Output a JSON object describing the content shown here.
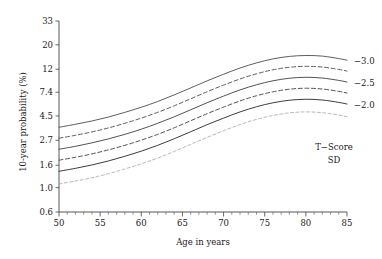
{
  "chart_data": {
    "type": "line",
    "title": "",
    "xlabel": "Age in years",
    "ylabel": "10-year probability (%)",
    "xlim": [
      50,
      85
    ],
    "ylim": [
      0.6,
      33
    ],
    "yscale": "log",
    "grid": false,
    "legend_position": "right",
    "legend_title_line1": "T−Score",
    "legend_title_line2": "SD",
    "x_ticks": [
      50,
      55,
      60,
      65,
      70,
      75,
      80,
      85
    ],
    "x_tick_labels": [
      "50",
      "55",
      "60",
      "65",
      "70",
      "75",
      "80",
      "85"
    ],
    "x_minor_step": 1,
    "y_ticks": [
      0.6,
      1.0,
      1.6,
      2.7,
      4.5,
      7.4,
      12,
      20,
      33
    ],
    "y_tick_labels": [
      "0.6",
      "1.0",
      "1.6",
      "2.7",
      "4.5",
      "7.4",
      "12",
      "20",
      "33"
    ],
    "x": [
      50,
      52,
      54,
      56,
      58,
      60,
      62,
      64,
      66,
      68,
      70,
      72,
      74,
      76,
      78,
      80,
      82,
      84,
      85
    ],
    "series": [
      {
        "name": "curve-1",
        "legend_label": "−3.0",
        "style": "solid",
        "color": "#555555",
        "values": [
          3.55,
          3.78,
          4.05,
          4.4,
          4.85,
          5.4,
          6.1,
          7.0,
          8.1,
          9.4,
          10.8,
          12.3,
          13.7,
          14.9,
          15.7,
          16.0,
          15.8,
          15.0,
          14.5
        ]
      },
      {
        "name": "curve-2",
        "legend_label": "",
        "style": "dashed",
        "color": "#555555",
        "values": [
          2.82,
          3.0,
          3.22,
          3.5,
          3.86,
          4.3,
          4.86,
          5.57,
          6.45,
          7.48,
          8.6,
          9.78,
          10.9,
          11.85,
          12.5,
          12.75,
          12.55,
          11.95,
          11.55
        ]
      },
      {
        "name": "curve-3",
        "legend_label": "−2.5",
        "style": "solid",
        "color": "#4a4a4a",
        "values": [
          2.24,
          2.38,
          2.56,
          2.78,
          3.06,
          3.41,
          3.86,
          4.42,
          5.12,
          5.94,
          6.83,
          7.77,
          8.66,
          9.41,
          9.93,
          10.13,
          9.97,
          9.49,
          9.17
        ]
      },
      {
        "name": "curve-4",
        "legend_label": "",
        "style": "dashed",
        "color": "#4a4a4a",
        "values": [
          1.78,
          1.89,
          2.03,
          2.21,
          2.43,
          2.71,
          3.06,
          3.51,
          4.07,
          4.72,
          5.42,
          6.17,
          6.88,
          7.47,
          7.89,
          8.05,
          7.92,
          7.54,
          7.28
        ]
      },
      {
        "name": "curve-5",
        "legend_label": "−2.0",
        "style": "solid",
        "color": "#333333",
        "values": [
          1.41,
          1.5,
          1.61,
          1.75,
          1.93,
          2.15,
          2.43,
          2.79,
          3.23,
          3.75,
          4.3,
          4.9,
          5.46,
          5.93,
          6.26,
          6.39,
          6.29,
          5.98,
          5.78
        ]
      },
      {
        "name": "curve-6",
        "legend_label": "",
        "style": "dotted",
        "color": "#aaaaaa",
        "values": [
          1.08,
          1.15,
          1.23,
          1.34,
          1.48,
          1.65,
          1.86,
          2.14,
          2.48,
          2.87,
          3.3,
          3.76,
          4.19,
          4.55,
          4.8,
          4.9,
          4.82,
          4.59,
          4.43
        ]
      }
    ]
  },
  "legend": {
    "entries": [
      {
        "label": "−3.0"
      },
      {
        "label": "−2.5"
      },
      {
        "label": "−2.0"
      }
    ],
    "title_line1": "T−Score",
    "title_line2": "SD"
  }
}
